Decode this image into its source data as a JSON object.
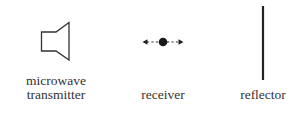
{
  "items": [
    {
      "name": "microwave-transmitter",
      "label_line1": "microwave",
      "label_line2": "transmitter"
    },
    {
      "name": "receiver",
      "label_line1": "receiver"
    },
    {
      "name": "reflector",
      "label_line1": "reflector"
    }
  ],
  "colors": {
    "stroke": "#333333",
    "fill": "#1a1a1a",
    "background": "#ffffff"
  }
}
